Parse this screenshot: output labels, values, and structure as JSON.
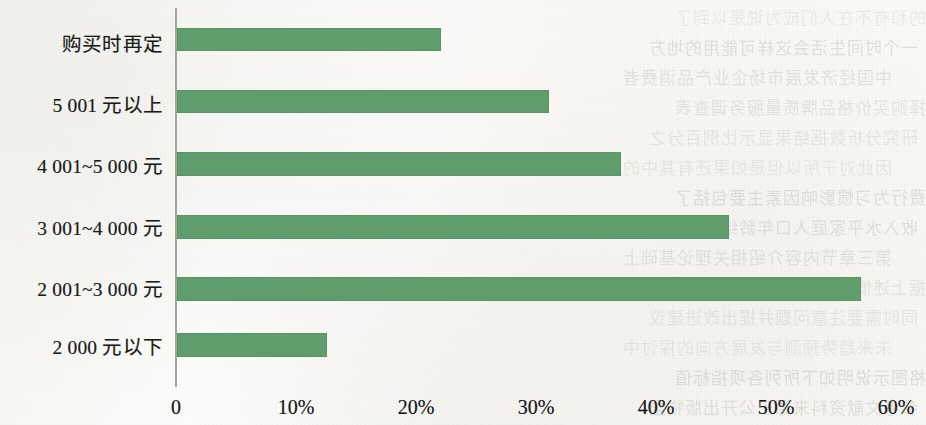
{
  "chart_data": {
    "type": "bar",
    "orientation": "horizontal",
    "title": "",
    "subtitle": "",
    "xlabel": "",
    "ylabel": "",
    "categories": [
      "购买时再定",
      "5 001 元以上",
      "4 001~5 000 元",
      "3 001~4 000 元",
      "2 001~3 000 元",
      "2 000 元以下"
    ],
    "values": [
      22,
      31,
      37,
      46,
      57,
      12.5
    ],
    "value_labels_visible": false,
    "xlim": [
      0,
      60
    ],
    "xtick_labels": [
      "0",
      "10%",
      "20%",
      "30%",
      "40%",
      "50%",
      "60%"
    ],
    "xtick_values": [
      0,
      10,
      20,
      30,
      40,
      50,
      60
    ],
    "grid": false,
    "legend": null,
    "legend_position": "none",
    "bar_color": "#5f9e6c",
    "axis_color": "#9aa99b",
    "background_color": "#fbfbf9"
  },
  "showthrough_lines": [
    "的的和有不在人们成为说是以到了",
    "一个时间生活会这样可能用的地方",
    "中国经济发展市场企业产品消费者",
    "选择购买价格品牌质量服务调查表",
    "研究分析数据结果显示比例百分之",
    "因此对于所以但是如果还有其中的",
    "消费行为习惯影响因素主要包括了",
    "收入水平家庭人口年龄结构教育的",
    "第三章节内容介绍相关理论基础上",
    "根据上述情况进行总结归纳出结论",
    "同时需要注意问题并提出改进建议",
    "未来趋势预测与发展方向的探讨中",
    "表格图示说明如下所列各项指标值",
    "参考文献资料来源于公开出版物里"
  ]
}
